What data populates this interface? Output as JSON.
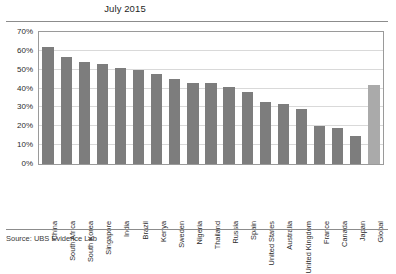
{
  "chart_data": {
    "type": "bar",
    "title": "July 2015",
    "xlabel": "",
    "ylabel": "",
    "ylim": [
      0,
      70
    ],
    "ytick_labels": [
      "70%",
      "60%",
      "50%",
      "40%",
      "30%",
      "20%",
      "10%",
      "0%"
    ],
    "ytick_values": [
      70,
      60,
      50,
      40,
      30,
      20,
      10,
      0
    ],
    "grid": true,
    "legend": "none",
    "categories": [
      "China",
      "South Africa",
      "South Korea",
      "Singapore",
      "India",
      "Brazil",
      "Kenya",
      "Sweden",
      "Nigeria",
      "Thailand",
      "Russia",
      "Spain",
      "United States",
      "Australia",
      "United Kingdom",
      "France",
      "Canada",
      "Japan",
      "Global"
    ],
    "values": [
      62,
      57,
      54,
      53,
      51,
      50,
      48,
      45,
      43,
      43,
      41,
      38,
      33,
      32,
      29,
      20,
      19,
      15,
      42
    ],
    "highlight_category": "Global",
    "colors": {
      "bar": "#7d7d7d",
      "highlight_bar": "#aaaaaa",
      "gridline": "#d9d9d9",
      "frame": "#9a9a9a",
      "text": "#2b2b2b",
      "background": "#ffffff"
    }
  },
  "footer": {
    "source": "Source: UBS Evidence Lab"
  }
}
